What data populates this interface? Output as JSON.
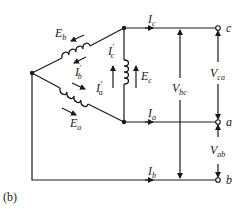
{
  "figure": {
    "caption": "(b)"
  },
  "sources": {
    "a": {
      "emf": "E",
      "emf_sub": "a",
      "phase_current": "I",
      "phase_current_sub": "a",
      "prime": "′"
    },
    "b": {
      "emf": "E",
      "emf_sub": "b",
      "phase_current": "I",
      "phase_current_sub": "b",
      "prime": "′"
    },
    "c": {
      "emf": "E",
      "emf_sub": "c",
      "phase_current": "I",
      "phase_current_sub": "c",
      "prime": "′"
    }
  },
  "lines": {
    "c": {
      "current": "I",
      "current_sub": "c",
      "terminal": "c"
    },
    "a": {
      "current": "I",
      "current_sub": "a",
      "terminal": "a"
    },
    "b": {
      "current": "I",
      "current_sub": "b",
      "terminal": "b"
    }
  },
  "voltages": {
    "bc": {
      "symbol": "V",
      "sub": "bc"
    },
    "ca": {
      "symbol": "V",
      "sub": "ca"
    },
    "ab": {
      "symbol": "V",
      "sub": "ab"
    }
  }
}
